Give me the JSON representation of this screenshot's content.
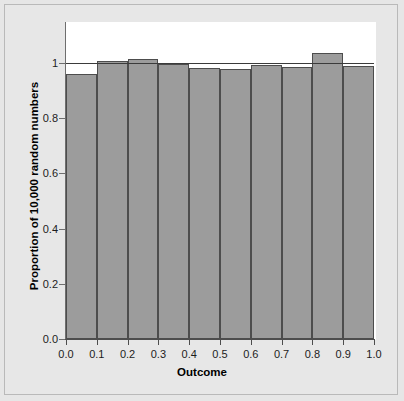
{
  "chart_data": {
    "type": "bar",
    "title": "",
    "subtitle": "",
    "xlabel": "Outcome",
    "ylabel": "Proportion of 10,000 random numbers",
    "categories": [
      "0.0-0.1",
      "0.1-0.2",
      "0.2-0.3",
      "0.3-0.4",
      "0.4-0.5",
      "0.5-0.6",
      "0.6-0.7",
      "0.7-0.8",
      "0.8-0.9",
      "0.9-1.0"
    ],
    "bin_edges": [
      0.0,
      0.1,
      0.2,
      0.3,
      0.4,
      0.5,
      0.6,
      0.7,
      0.8,
      0.9,
      1.0
    ],
    "values": [
      0.962,
      1.006,
      1.016,
      0.996,
      0.982,
      0.98,
      0.994,
      0.986,
      1.036,
      0.99
    ],
    "xlim": [
      0.0,
      1.0
    ],
    "ylim": [
      0.0,
      1.09
    ],
    "xticks": [
      "0.0",
      "0.1",
      "0.2",
      "0.3",
      "0.4",
      "0.5",
      "0.6",
      "0.7",
      "0.8",
      "0.9",
      "1.0"
    ],
    "xtick_values": [
      0.0,
      0.1,
      0.2,
      0.3,
      0.4,
      0.5,
      0.6,
      0.7,
      0.8,
      0.9,
      1.0
    ],
    "yticks": [
      "0.0",
      "0.2",
      "0.4",
      "0.6",
      "0.8",
      "1"
    ],
    "ytick_values": [
      0.0,
      0.2,
      0.4,
      0.6,
      0.8,
      1.0
    ],
    "grid": false,
    "legend": null,
    "reference_line": {
      "orientation": "horizontal",
      "value": 1.0,
      "color": "#3b3b3b"
    },
    "bar_color": "#9c9c9c",
    "bar_edge_color": "#4d4d4d",
    "panel_color": "#ffffff",
    "figure_color": "#e7e7e7"
  }
}
